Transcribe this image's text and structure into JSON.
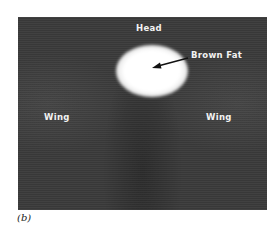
{
  "figure": {
    "caption": "(b)",
    "image_type": "thermogram",
    "labels": {
      "head": "Head",
      "brown_fat": "Brown Fat",
      "wing_left": "Wing",
      "wing_right": "Wing"
    },
    "colors": {
      "background": "#3a3a3a",
      "hotspot": "#ffffff",
      "label_text": "#f2f2f2"
    }
  }
}
